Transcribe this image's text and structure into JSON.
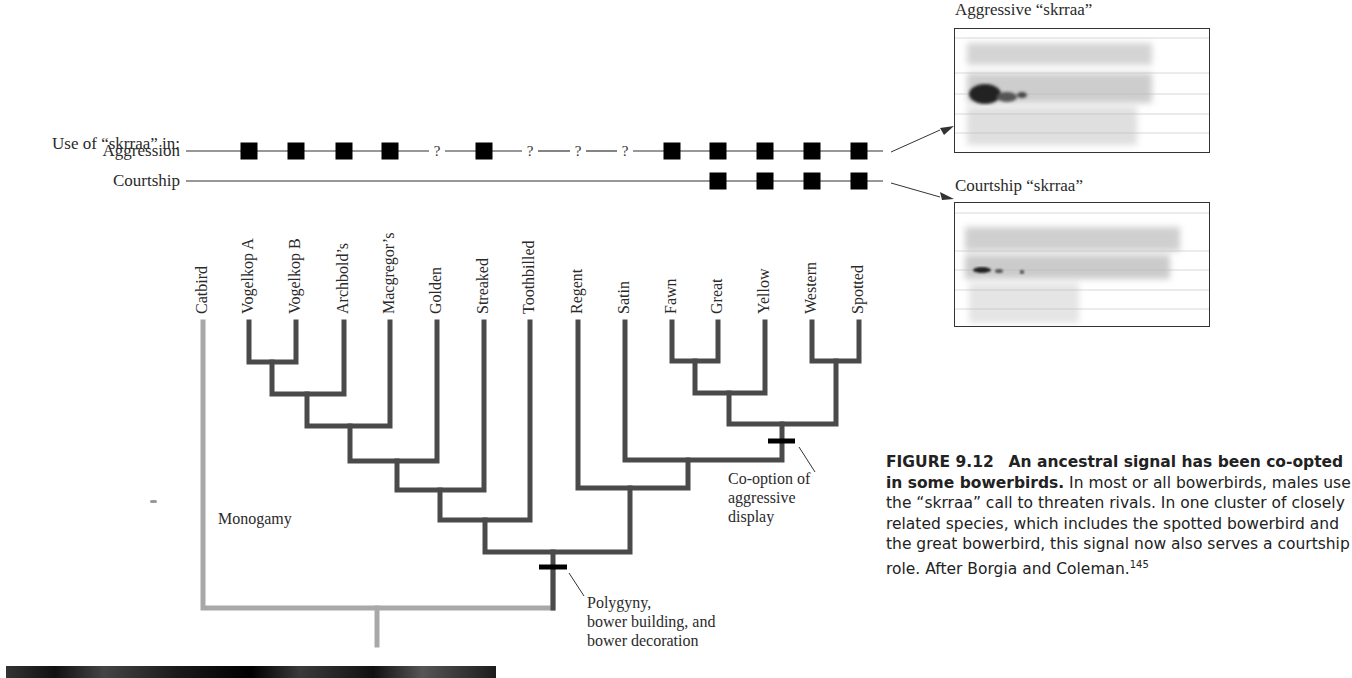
{
  "figure": {
    "number": "FIGURE 9.12",
    "title": "An ancestral signal has been co-opted in some bowerbirds.",
    "caption_body": "In most or all bowerbirds, males use the “skrraa” call to threaten rivals. In one cluster of closely related species, which includes the spotted bowerbird and the great bowerbird, this signal now also serves a courtship role. After Borgia and Coleman.",
    "citation_superscript": "145"
  },
  "trait_rows": {
    "header": "Use of “skrraa” in:",
    "aggression_label": "Aggression",
    "courtship_label": "Courtship",
    "unknown_marker": "?"
  },
  "species": [
    {
      "name": "Catbird",
      "x": 203,
      "aggression": "none",
      "courtship": "none"
    },
    {
      "name": "Vogelkop A",
      "x": 249,
      "aggression": "present",
      "courtship": "none"
    },
    {
      "name": "Vogelkop B",
      "x": 296,
      "aggression": "present",
      "courtship": "none"
    },
    {
      "name": "Archbold’s",
      "x": 344,
      "aggression": "present",
      "courtship": "none"
    },
    {
      "name": "Macgregor’s",
      "x": 390,
      "aggression": "present",
      "courtship": "none"
    },
    {
      "name": "Golden",
      "x": 437,
      "aggression": "unknown",
      "courtship": "none"
    },
    {
      "name": "Streaked",
      "x": 484,
      "aggression": "present",
      "courtship": "none"
    },
    {
      "name": "Toothbilled",
      "x": 530,
      "aggression": "unknown",
      "courtship": "none"
    },
    {
      "name": "Regent",
      "x": 578,
      "aggression": "unknown",
      "courtship": "none"
    },
    {
      "name": "Satin",
      "x": 625,
      "aggression": "unknown",
      "courtship": "none"
    },
    {
      "name": "Fawn",
      "x": 672,
      "aggression": "present",
      "courtship": "none"
    },
    {
      "name": "Great",
      "x": 718,
      "aggression": "present",
      "courtship": "present"
    },
    {
      "name": "Yellow",
      "x": 765,
      "aggression": "present",
      "courtship": "present"
    },
    {
      "name": "Western",
      "x": 812,
      "aggression": "present",
      "courtship": "present"
    },
    {
      "name": "Spotted",
      "x": 859,
      "aggression": "present",
      "courtship": "present"
    }
  ],
  "annotations": {
    "monogamy": "Monogamy",
    "polygyny_line1": "Polygyny,",
    "polygyny_line2": "bower building, and",
    "polygyny_line3": "bower decoration",
    "cooption_line1": "Co-option of",
    "cooption_line2": "aggressive",
    "cooption_line3": "display"
  },
  "spectrograms": {
    "aggressive_title": "Aggressive “skrraa”",
    "courtship_title": "Courtship “skrraa”"
  },
  "colors": {
    "branch_dark": "#4a4a4a",
    "branch_light": "#a8a8a8",
    "marker": "#000000",
    "text": "#2a2a2a"
  }
}
